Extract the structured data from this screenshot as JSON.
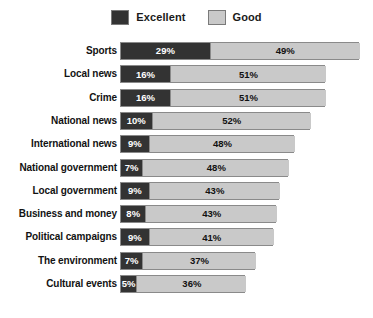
{
  "legend": {
    "entries": [
      {
        "label": "Excellent",
        "color": "#333333",
        "swatch_name": "legend-swatch-excellent"
      },
      {
        "label": "Good",
        "color": "#c9c9c9",
        "swatch_name": "legend-swatch-good"
      }
    ]
  },
  "chart_data": {
    "type": "bar",
    "orientation": "horizontal",
    "stacked": true,
    "title": "",
    "subtitle": "",
    "xlabel": "",
    "ylabel": "",
    "xlim": [
      0,
      80
    ],
    "grid": false,
    "legend_position": "top-center",
    "value_suffix": "%",
    "categories": [
      "Sports",
      "Local news",
      "Crime",
      "National news",
      "International news",
      "National government",
      "Local government",
      "Business and money",
      "Political campaigns",
      "The environment",
      "Cultural events"
    ],
    "series": [
      {
        "name": "Excellent",
        "color": "#333333",
        "values": [
          29,
          16,
          16,
          10,
          9,
          7,
          9,
          8,
          9,
          7,
          5
        ],
        "labels": [
          "29%",
          "16%",
          "16%",
          "10%",
          "9%",
          "7%",
          "9%",
          "8%",
          "9%",
          "7%",
          "5%"
        ]
      },
      {
        "name": "Good",
        "color": "#c9c9c9",
        "values": [
          49,
          51,
          51,
          52,
          48,
          48,
          43,
          43,
          41,
          37,
          36
        ],
        "labels": [
          "49%",
          "51%",
          "51%",
          "52%",
          "48%",
          "48%",
          "43%",
          "43%",
          "41%",
          "37%",
          "36%"
        ]
      }
    ],
    "totals": [
      78,
      67,
      67,
      62,
      57,
      55,
      52,
      51,
      50,
      44,
      41
    ]
  }
}
